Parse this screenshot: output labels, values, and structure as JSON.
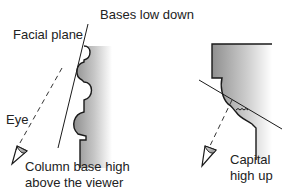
{
  "labels": {
    "bases_low_down": "Bases low down",
    "facial_plane": "Facial plane",
    "eye": "Eye",
    "column_base_line1": "Column base high",
    "column_base_line2": "above the viewer",
    "capital_line1": "Capital",
    "capital_line2": "high up"
  },
  "colors": {
    "outline": "#1a1a1a",
    "shade_dark": "#9a9a9a",
    "shade_light": "#ffffff",
    "eye_fill": "#bdbdbd"
  }
}
